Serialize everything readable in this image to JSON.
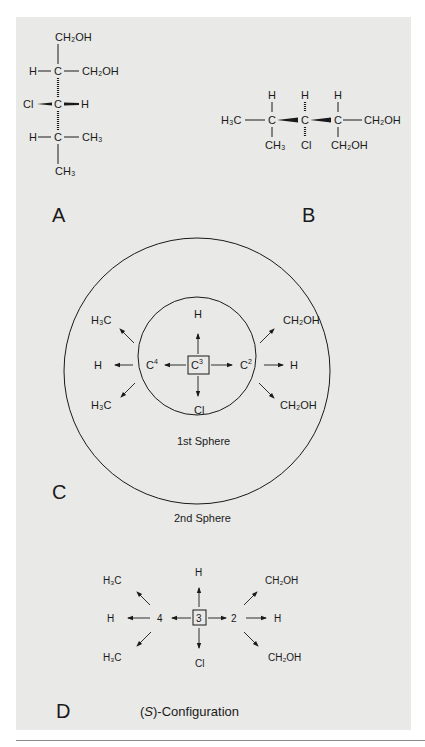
{
  "figure": {
    "panels": {
      "A": {
        "label": "A",
        "atoms": {
          "top": "CH₂OH",
          "c1_left": "H",
          "c1_center": "C",
          "c1_right": "CH₂OH",
          "c2_left": "Cl",
          "c2_center": "C",
          "c2_right": "H",
          "c3_left": "H",
          "c3_center": "C",
          "c3_right": "CH₃",
          "bottom": "CH₃"
        }
      },
      "B": {
        "label": "B",
        "atoms": {
          "left": "H₃C",
          "c1": "C",
          "c1_top": "H",
          "c1_bottom": "CH₃",
          "c2": "C",
          "c2_top": "H",
          "c2_bottom": "Cl",
          "c3": "C",
          "c3_top": "H",
          "c3_bottom": "CH₂OH",
          "right": "CH₂OH"
        }
      },
      "C": {
        "label": "C",
        "center": "C",
        "center_sup": "3",
        "up": "H",
        "down": "Cl",
        "left_atom": "C",
        "left_sup": "4",
        "right_atom": "C",
        "right_sup": "2",
        "left_branches": [
          "H₃C",
          "H",
          "H₃C"
        ],
        "right_branches": [
          "CH₂OH",
          "H",
          "CH₂OH"
        ],
        "inner_caption": "1st Sphere",
        "outer_caption": "2nd Sphere"
      },
      "D": {
        "label": "D",
        "center": "3",
        "up": "H",
        "down": "Cl",
        "left_atom": "4",
        "right_atom": "2",
        "left_branches": [
          "H₃C",
          "H",
          "H₃C"
        ],
        "right_branches": [
          "CH₂OH",
          "H",
          "CH₂OH"
        ],
        "caption_italic": "S",
        "caption_pre": "(",
        "caption_post": ")-Configuration"
      }
    },
    "colors": {
      "panel_bg": "#e9e9e7",
      "ink": "#1a1a1a",
      "rule": "#8a8a8a"
    }
  }
}
